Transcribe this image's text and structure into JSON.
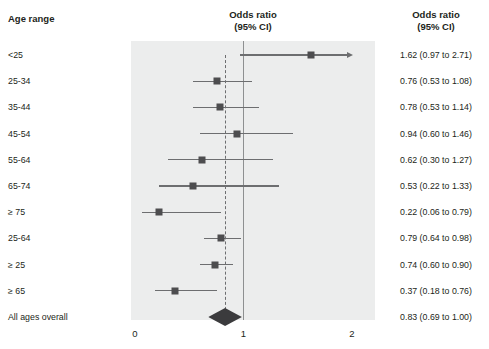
{
  "headers": {
    "left_column": "Age range",
    "plot_column": "Odds ratio\n(95% CI)",
    "value_column": "Odds ratio\n(95% CI)"
  },
  "axis": {
    "ticks": [
      "0",
      "1",
      "2"
    ],
    "min": 0,
    "max": 2,
    "null_value": 1
  },
  "colors": {
    "panel_background": "#eceded",
    "marker": "#4d4d4f",
    "line": "#6d6e70",
    "null_line": "#8e9091",
    "diamond": "#3b3b3d",
    "text": "#231f20"
  },
  "rows": [
    {
      "label": "<25",
      "value_text": "1.62 (0.97 to 2.71)",
      "or": 1.62,
      "low": 0.97,
      "high": 2.71,
      "truncated_high": true
    },
    {
      "label": "25-34",
      "value_text": "0.76 (0.53 to 1.08)",
      "or": 0.76,
      "low": 0.53,
      "high": 1.08,
      "truncated_high": false
    },
    {
      "label": "35-44",
      "value_text": "0.78 (0.53 to 1.14)",
      "or": 0.78,
      "low": 0.53,
      "high": 1.14,
      "truncated_high": false
    },
    {
      "label": "45-54",
      "value_text": "0.94 (0.60 to 1.46)",
      "or": 0.94,
      "low": 0.6,
      "high": 1.46,
      "truncated_high": false
    },
    {
      "label": "55-64",
      "value_text": "0.62 (0.30 to 1.27)",
      "or": 0.62,
      "low": 0.3,
      "high": 1.27,
      "truncated_high": false
    },
    {
      "label": "65-74",
      "value_text": "0.53 (0.22 to 1.33)",
      "or": 0.53,
      "low": 0.22,
      "high": 1.33,
      "truncated_high": false
    },
    {
      "label": "≥ 75",
      "value_text": "0.22 (0.06 to 0.79)",
      "or": 0.22,
      "low": 0.06,
      "high": 0.79,
      "truncated_high": false
    },
    {
      "label": "25-64",
      "value_text": "0.79 (0.64 to 0.98)",
      "or": 0.79,
      "low": 0.64,
      "high": 0.98,
      "truncated_high": false
    },
    {
      "label": "≥ 25",
      "value_text": "0.74 (0.60 to 0.90)",
      "or": 0.74,
      "low": 0.6,
      "high": 0.9,
      "truncated_high": false
    },
    {
      "label": "≥ 65",
      "value_text": "0.37 (0.18 to 0.76)",
      "or": 0.37,
      "low": 0.18,
      "high": 0.76,
      "truncated_high": false
    },
    {
      "label": "All ages overall",
      "value_text": "0.83 (0.69 to 1.00)",
      "or": 0.83,
      "low": 0.69,
      "high": 1.0,
      "summary": true
    }
  ],
  "chart_data": {
    "type": "scatter",
    "subtype": "forest-plot",
    "title": "",
    "xlabel": "Odds ratio (95% CI)",
    "ylabel": "Age range",
    "xlim": [
      0,
      2
    ],
    "xticks": [
      0,
      1,
      2
    ],
    "reference_line": 1,
    "pooled_line": 0.83,
    "grid": false,
    "legend": null,
    "categories": [
      "<25",
      "25-34",
      "35-44",
      "45-54",
      "55-64",
      "65-74",
      "≥ 75",
      "25-64",
      "≥ 25",
      "≥ 65",
      "All ages overall"
    ],
    "values": [
      1.62,
      0.76,
      0.78,
      0.94,
      0.62,
      0.53,
      0.22,
      0.79,
      0.74,
      0.37,
      0.83
    ],
    "ci_low": [
      0.97,
      0.53,
      0.53,
      0.6,
      0.3,
      0.22,
      0.06,
      0.64,
      0.6,
      0.18,
      0.69
    ],
    "ci_high": [
      2.71,
      1.08,
      1.14,
      1.46,
      1.27,
      1.33,
      0.79,
      0.98,
      0.9,
      0.76,
      1.0
    ]
  }
}
